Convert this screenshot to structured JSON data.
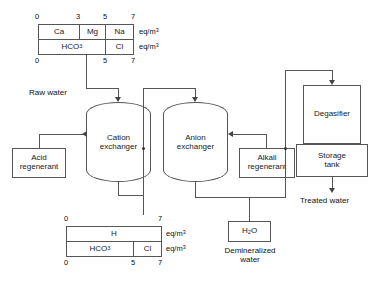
{
  "diagram": {
    "raw_water_table": {
      "top_ticks": [
        "0",
        "3",
        "5",
        "7"
      ],
      "bottom_ticks": [
        "0",
        "5",
        "7"
      ],
      "cations": [
        "Ca",
        "Mg",
        "Na"
      ],
      "anions": [
        "HCO",
        "Cl"
      ],
      "anion_sub": "3",
      "unit_row1": "eq/m",
      "unit_row1_sup": "3",
      "unit_row2": "eq/m",
      "unit_row2_sup": "3"
    },
    "treated_water_table": {
      "top_ticks": [
        "0",
        "7"
      ],
      "bottom_ticks": [
        "0",
        "5",
        "7"
      ],
      "cations": [
        "H"
      ],
      "anions": [
        "HCO",
        "Cl"
      ],
      "anion_sub": "3",
      "unit_row1": "eq/m",
      "unit_row1_sup": "3",
      "unit_row2": "eq/m",
      "unit_row2_sup": "3"
    },
    "vessels": {
      "cation_exchanger": "Cation\nexchanger",
      "cation_exchanger_line1": "Cation",
      "cation_exchanger_line2": "exchanger",
      "anion_exchanger_line1": "Anion",
      "anion_exchanger_line2": "exchanger"
    },
    "boxes": {
      "acid_regenerant_line1": "Acid",
      "acid_regenerant_line2": "regenerant",
      "alkali_regenerant_line1": "Alkali",
      "alkali_regenerant_line2": "regenerant",
      "degasifier": "Degasifier",
      "storage_tank_line1": "Storage",
      "storage_tank_line2": "tank",
      "water_formula": "H",
      "water_formula_sub": "2",
      "water_formula_tail": "O"
    },
    "stream_labels": {
      "raw_water": "Raw water",
      "treated_water": "Treated water",
      "demineralized_line1": "Demineralized",
      "demineralized_line2": "water"
    },
    "colors": {
      "line": "#555555",
      "text": "#1a1a1a",
      "background": "#ffffff"
    }
  }
}
